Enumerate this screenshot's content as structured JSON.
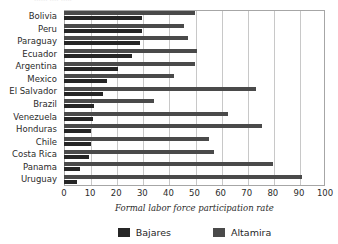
{
  "title_remnant": "......  ....  .....",
  "colors": {
    "bajares": "#262626",
    "altamira": "#4a4a4a",
    "gridline": "#c8c8c8",
    "frame": "#a6a6a6",
    "plot_background": "#ffffff",
    "text": "#2b2b2b"
  },
  "axis": {
    "x_title": "Formal labor force participation rate",
    "x_ticks": [
      "0",
      "10",
      "20",
      "30",
      "40",
      "50",
      "60",
      "70",
      "80",
      "90",
      "100"
    ]
  },
  "legend": {
    "items": [
      {
        "label": "Bajares",
        "color": "#262626"
      },
      {
        "label": "Altamira",
        "color": "#4a4a4a"
      }
    ]
  },
  "chart_data": {
    "type": "bar",
    "orientation": "horizontal",
    "title": "",
    "xlabel": "Formal labor force participation rate",
    "ylabel": "",
    "xlim": [
      0,
      100
    ],
    "xticks": [
      0,
      10,
      20,
      30,
      40,
      50,
      60,
      70,
      80,
      90,
      100
    ],
    "grid": true,
    "grid_axis": "x",
    "legend_position": "bottom",
    "categories": [
      "Bolivia",
      "Peru",
      "Paraguay",
      "Ecuador",
      "Argentina",
      "Mexico",
      "El Salvador",
      "Brazil",
      "Venezuela",
      "Honduras",
      "Chile",
      "Costa Rica",
      "Panama",
      "Uruguay"
    ],
    "series": [
      {
        "name": "Altamira",
        "color": "#4a4a4a",
        "values": [
          50,
          46,
          47.5,
          51,
          50,
          42,
          73.5,
          34.5,
          63,
          76,
          55.5,
          57.5,
          80,
          91
        ]
      },
      {
        "name": "Bajares",
        "color": "#262626",
        "values": [
          30,
          30,
          29,
          26,
          20.5,
          16.5,
          15,
          11.5,
          11,
          10.5,
          10.5,
          9.5,
          6,
          5
        ]
      }
    ]
  }
}
